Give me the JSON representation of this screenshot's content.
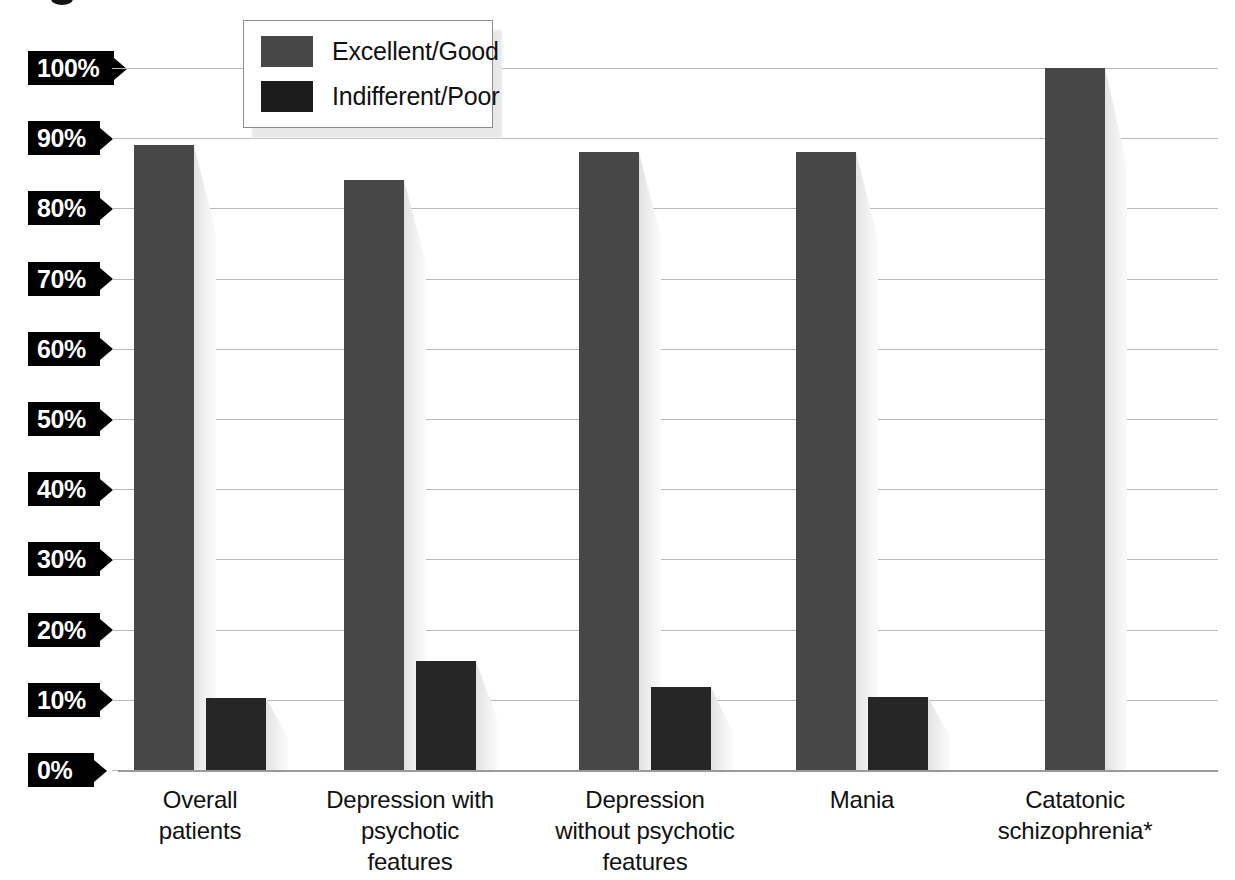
{
  "chart_data": {
    "type": "bar",
    "title": "",
    "subtitle": "",
    "xlabel": "",
    "ylabel": "",
    "ylim": [
      0,
      100
    ],
    "grid": true,
    "legend_position": "top-center",
    "y_ticks": [
      "0%",
      "10%",
      "20%",
      "30%",
      "40%",
      "50%",
      "60%",
      "70%",
      "80%",
      "90%",
      "100%"
    ],
    "y_tick_values": [
      0,
      10,
      20,
      30,
      40,
      50,
      60,
      70,
      80,
      90,
      100
    ],
    "categories": [
      "Overall\npatients",
      "Depression with\npsychotic\nfeatures",
      "Depression\nwithout psychotic\nfeatures",
      "Mania",
      "Catatonic\nschizophrenia*"
    ],
    "category_lines": [
      [
        "Overall",
        "patients"
      ],
      [
        "Depression with",
        "psychotic",
        "features"
      ],
      [
        "Depression",
        "without psychotic",
        "features"
      ],
      [
        "Mania"
      ],
      [
        "Catatonic",
        "schizophrenia*"
      ]
    ],
    "series": [
      {
        "name": "Excellent/Good",
        "color": "#474747",
        "values": [
          89,
          84,
          88,
          88,
          100
        ]
      },
      {
        "name": "Indifferent/Poor",
        "color": "#262626",
        "values": [
          10.3,
          15.5,
          11.8,
          10.4,
          0
        ]
      }
    ],
    "annotations": [
      "* Catatonic schizophrenia marked with an asterisk in the category label"
    ]
  },
  "legend": {
    "items": [
      {
        "label": "Excellent/Good",
        "swatch": "good-swatch",
        "color": "#474747"
      },
      {
        "label": "Indifferent/Poor",
        "swatch": "poor-swatch",
        "color": "#1c1c1c"
      }
    ]
  },
  "axis": {
    "y_labels": [
      {
        "text": "100%"
      },
      {
        "text": "90%"
      },
      {
        "text": "80%"
      },
      {
        "text": "70%"
      },
      {
        "text": "60%"
      },
      {
        "text": "50%"
      },
      {
        "text": "40%"
      },
      {
        "text": "30%"
      },
      {
        "text": "20%"
      },
      {
        "text": "10%"
      },
      {
        "text": "0%"
      }
    ]
  },
  "colors": {
    "series_good": "#474747",
    "series_poor": "#262626",
    "gridline": "#b9b9b9",
    "tag_background": "#000000",
    "tag_text": "#ffffff",
    "background": "#ffffff"
  }
}
